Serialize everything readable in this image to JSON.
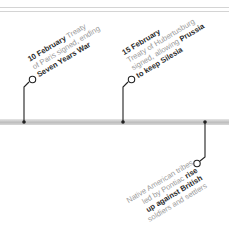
{
  "events": [
    {
      "date": "10 February",
      "lines": [
        {
          "bold": "10 February",
          "text": " Treaty"
        },
        {
          "text": "of Paris signed, ending"
        },
        {
          "bold": "Seven Years War"
        }
      ]
    },
    {
      "date": "15 February",
      "lines": [
        {
          "bold": "15 February"
        },
        {
          "text": "Treaty of Hubertusburg"
        },
        {
          "text": "signed, allowing ",
          "bold": "Prussia"
        },
        {
          "bold": "to keep Silesia"
        }
      ]
    },
    {
      "lines": [
        {
          "text": "Native American tribes"
        },
        {
          "text": "led by Pontiac ",
          "bold": "rise"
        },
        {
          "bold": "up against British"
        },
        {
          "text": "soldiers and settlers"
        }
      ]
    }
  ],
  "colors": {
    "connector": "#222222",
    "muted_text": "#9a9a9a",
    "strong_text": "#2a2a2a"
  }
}
